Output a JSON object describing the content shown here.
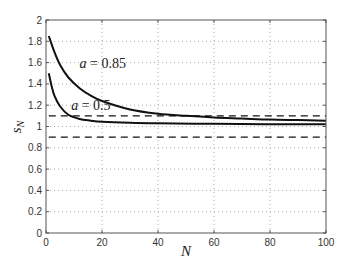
{
  "chart_data": {
    "type": "line",
    "title": "",
    "xlabel": "N",
    "ylabel": "s_N",
    "xlim": [
      0,
      100
    ],
    "ylim": [
      0,
      2
    ],
    "grid": true,
    "x_ticks": [
      "0",
      "20",
      "40",
      "60",
      "80",
      "100"
    ],
    "y_ticks": [
      "0",
      "0.2",
      "0.4",
      "0.6",
      "0.8",
      "1",
      "1.2",
      "1.4",
      "1.6",
      "1.8",
      "2"
    ],
    "annotations": [
      {
        "text": "a = 0.85",
        "x": 12,
        "y": 1.6
      },
      {
        "text": "a = 0.5",
        "x": 9,
        "y": 1.2
      }
    ],
    "series": [
      {
        "name": "a = 0.85",
        "style": "solid",
        "x": [
          1,
          3,
          5,
          8,
          12,
          16,
          20,
          30,
          40,
          50,
          60,
          70,
          80,
          90,
          100
        ],
        "y": [
          1.85,
          1.7,
          1.58,
          1.46,
          1.36,
          1.29,
          1.24,
          1.16,
          1.12,
          1.1,
          1.085,
          1.075,
          1.065,
          1.06,
          1.055
        ]
      },
      {
        "name": "a = 0.5",
        "style": "solid",
        "x": [
          1,
          2,
          3,
          5,
          8,
          12,
          16,
          20,
          30,
          40,
          60,
          80,
          100
        ],
        "y": [
          1.5,
          1.38,
          1.29,
          1.19,
          1.11,
          1.07,
          1.055,
          1.045,
          1.035,
          1.03,
          1.025,
          1.022,
          1.02
        ]
      },
      {
        "name": "upper bound",
        "style": "dashed",
        "x": [
          1,
          100
        ],
        "y": [
          1.1,
          1.1
        ]
      },
      {
        "name": "lower bound",
        "style": "dashed",
        "x": [
          1,
          100
        ],
        "y": [
          0.9,
          0.9
        ]
      }
    ]
  }
}
